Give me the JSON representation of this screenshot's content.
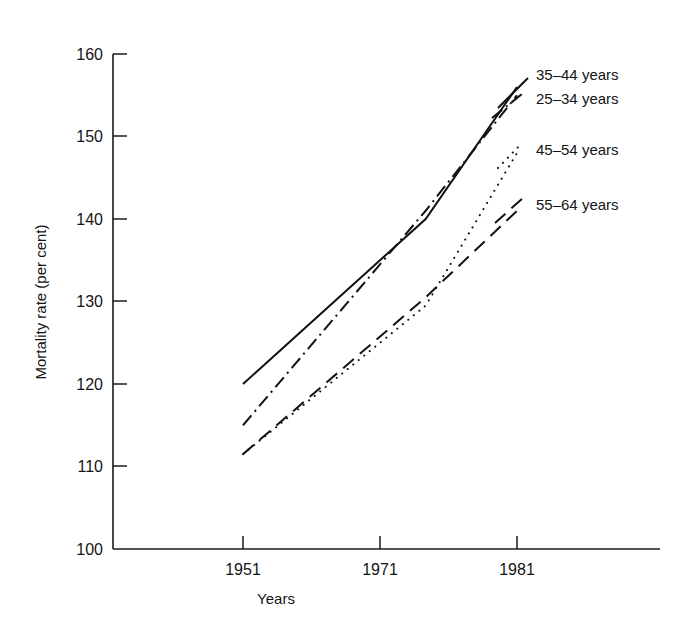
{
  "chart_data": {
    "type": "line",
    "title": "",
    "xlabel": "Years",
    "ylabel": "Mortality rate (per cent)",
    "x": [
      1951,
      1971,
      1981
    ],
    "xticklabels": [
      "1951",
      "1971",
      "1981"
    ],
    "yticklabels": [
      "100",
      "110",
      "120",
      "130",
      "140",
      "150",
      "160"
    ],
    "yticks": [
      100,
      110,
      120,
      130,
      140,
      150,
      160
    ],
    "ylim": [
      100,
      160
    ],
    "xlim": [
      1951,
      1981
    ],
    "grid": false,
    "legend_position": "right-inline",
    "series": [
      {
        "name": "35–44 years",
        "style": "solid",
        "values": [
          120,
          140,
          156
        ]
      },
      {
        "name": "25–34 years",
        "style": "dash-dot",
        "values": [
          115,
          141,
          155
        ]
      },
      {
        "name": "45–54 years",
        "style": "dotted",
        "values": [
          111.5,
          129.5,
          148
        ]
      },
      {
        "name": "55–64 years",
        "style": "dashed",
        "values": [
          111.5,
          130.5,
          141
        ]
      }
    ]
  },
  "axes": {
    "y_axis_title": "Mortality rate (per cent)",
    "x_axis_title": "Years",
    "y_tick_labels": [
      "160",
      "150",
      "140",
      "130",
      "120",
      "110",
      "100"
    ],
    "x_tick_labels": [
      "1951",
      "1971",
      "1981"
    ]
  },
  "legend": {
    "items": [
      {
        "label": "35–44 years",
        "style": "solid"
      },
      {
        "label": "25–34 years",
        "style": "dash-dot"
      },
      {
        "label": "45–54 years",
        "style": "dotted"
      },
      {
        "label": "55–64 years",
        "style": "dashed"
      }
    ]
  },
  "colors": {
    "ink": "#111111",
    "background": "#ffffff"
  }
}
